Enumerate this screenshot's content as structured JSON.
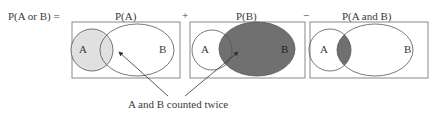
{
  "equation": {
    "lhs": "P(A or B) =",
    "term1": "P(A)",
    "op1": "+",
    "term2": "P(B)",
    "op2": "−",
    "term3": "P(A and B)"
  },
  "panels": [
    {
      "label_a": "A",
      "label_b": "B",
      "shaded": "A",
      "fill": "#e0e0e0"
    },
    {
      "label_a": "A",
      "label_b": "B",
      "shaded": "B",
      "fill": "#707070"
    },
    {
      "label_a": "A",
      "label_b": "B",
      "shaded": "intersection",
      "fill": "#707070"
    }
  ],
  "annotation": "A and B counted twice",
  "colors": {
    "light_fill": "#e0e0e0",
    "dark_fill": "#707070",
    "stroke": "#555555",
    "box": "#888888"
  }
}
